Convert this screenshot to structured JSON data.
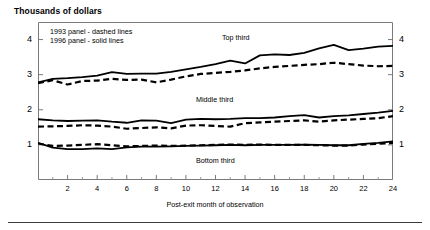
{
  "chart_data": {
    "type": "line",
    "title": "Thousands of dollars",
    "xlabel": "Post-exit month of observation",
    "ylabel": "",
    "xlim": [
      0,
      24
    ],
    "ylim": [
      0,
      4.5
    ],
    "xticks": [
      2,
      4,
      6,
      8,
      10,
      12,
      14,
      16,
      18,
      20,
      22,
      24
    ],
    "xtick_labels": [
      "2",
      "4",
      "6",
      "8",
      "10",
      "12",
      "14",
      "16",
      "18",
      "20",
      "22",
      "24"
    ],
    "xminor_ticks": [
      1,
      3,
      5,
      7,
      9,
      11,
      13,
      15,
      17,
      19,
      21,
      23
    ],
    "yticks": [
      1,
      2,
      3,
      4
    ],
    "ytick_labels": [
      "1",
      "2",
      "3",
      "4"
    ],
    "ytick_labels_right": [
      "1",
      "2",
      "3",
      "4"
    ],
    "grid": false,
    "legend_position": "inside-top-left",
    "legend_entries": [
      "1993 panel - dashed lines",
      "1996 panel - solid lines"
    ],
    "annotations": [
      {
        "text": "Top third",
        "x": 11.5,
        "y": 3.95
      },
      {
        "text": "Middle third",
        "x": 10.0,
        "y": 2.15
      },
      {
        "text": "Bottom third",
        "x": 10.0,
        "y": 0.72
      }
    ],
    "x": [
      0,
      1,
      2,
      3,
      4,
      5,
      6,
      7,
      8,
      9,
      10,
      11,
      12,
      13,
      14,
      15,
      16,
      17,
      18,
      19,
      20,
      21,
      22,
      23,
      24
    ],
    "series": [
      {
        "name": "Top third (1996 panel)",
        "panel": "1996",
        "tercile": "top",
        "style": "solid",
        "color": "#000000",
        "values": [
          2.78,
          2.88,
          2.9,
          2.93,
          2.97,
          3.07,
          3.02,
          3.03,
          3.03,
          3.08,
          3.15,
          3.22,
          3.3,
          3.4,
          3.32,
          3.55,
          3.58,
          3.56,
          3.62,
          3.75,
          3.85,
          3.7,
          3.74,
          3.8,
          3.82
        ]
      },
      {
        "name": "Top third (1993 panel)",
        "panel": "1993",
        "tercile": "top",
        "style": "dashed",
        "color": "#000000",
        "values": [
          2.76,
          2.84,
          2.72,
          2.82,
          2.83,
          2.88,
          2.85,
          2.86,
          2.78,
          2.86,
          2.95,
          3.02,
          3.05,
          3.08,
          3.12,
          3.18,
          3.22,
          3.25,
          3.28,
          3.3,
          3.34,
          3.3,
          3.26,
          3.24,
          3.25
        ]
      },
      {
        "name": "Middle third (1996 panel)",
        "panel": "1996",
        "tercile": "middle",
        "style": "solid",
        "color": "#000000",
        "values": [
          1.73,
          1.7,
          1.68,
          1.69,
          1.7,
          1.66,
          1.63,
          1.7,
          1.69,
          1.62,
          1.72,
          1.74,
          1.73,
          1.74,
          1.76,
          1.76,
          1.78,
          1.82,
          1.85,
          1.78,
          1.82,
          1.84,
          1.88,
          1.92,
          1.97
        ]
      },
      {
        "name": "Middle third (1993 panel)",
        "panel": "1993",
        "tercile": "middle",
        "style": "dashed",
        "color": "#000000",
        "values": [
          1.52,
          1.53,
          1.54,
          1.56,
          1.55,
          1.52,
          1.46,
          1.48,
          1.5,
          1.47,
          1.55,
          1.56,
          1.54,
          1.52,
          1.62,
          1.64,
          1.66,
          1.68,
          1.7,
          1.66,
          1.7,
          1.72,
          1.74,
          1.76,
          1.82
        ]
      },
      {
        "name": "Bottom third (1996 panel)",
        "panel": "1996",
        "tercile": "bottom",
        "style": "solid",
        "color": "#000000",
        "values": [
          1.06,
          0.92,
          0.88,
          0.88,
          0.9,
          0.88,
          0.93,
          0.95,
          0.95,
          0.96,
          0.97,
          0.98,
          0.99,
          1.0,
          0.99,
          1.0,
          1.0,
          1.0,
          1.01,
          1.0,
          0.99,
          0.99,
          1.03,
          1.06,
          1.1
        ]
      },
      {
        "name": "Bottom third (1993 panel)",
        "panel": "1993",
        "tercile": "bottom",
        "style": "dashed",
        "color": "#000000",
        "values": [
          1.04,
          0.97,
          0.98,
          1.0,
          1.02,
          0.99,
          0.96,
          0.97,
          0.98,
          0.97,
          0.98,
          0.99,
          1.0,
          1.01,
          1.0,
          1.01,
          1.0,
          1.0,
          1.0,
          0.99,
          0.98,
          0.98,
          1.01,
          1.03,
          1.06
        ]
      }
    ]
  }
}
